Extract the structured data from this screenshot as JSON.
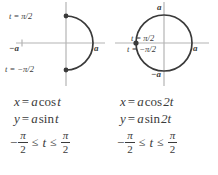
{
  "colors": {
    "curve": "#3a3a3a",
    "axis": "#b4b4b4",
    "text": "#3b3b3b",
    "background": "#ffffff"
  },
  "figures": [
    {
      "id": "semicircle-right-half",
      "shape": "semicircle",
      "description": "Right half of a circle of radius a, traced from bottom to top",
      "labels": {
        "t_top": "t = π/2",
        "t_bottom": "t = −π/2",
        "axis_left": "−a",
        "axis_right": "a"
      },
      "endpoints_marked": 2
    },
    {
      "id": "full-circle",
      "shape": "circle",
      "description": "Full circle of radius a traced twice as fast",
      "labels": {
        "axis_top": "a",
        "axis_bottom": "−a",
        "axis_right": "a",
        "t_pos": "t = π/2",
        "t_neg": "t = −π/2"
      },
      "endpoints_marked": 1
    }
  ],
  "equations": [
    {
      "x_lhs": "x",
      "x_eq": "=",
      "x_rhs_coef": "a",
      "x_rhs_fn": "cos",
      "x_rhs_arg": "t",
      "y_lhs": "y",
      "y_eq": "=",
      "y_rhs_coef": "a",
      "y_rhs_fn": "sin",
      "y_rhs_arg": "t",
      "domain": {
        "leading_minus": "−",
        "left_num": "π",
        "left_den": "2",
        "rel_left": "≤",
        "variable": "t",
        "rel_right": "≤",
        "right_num": "π",
        "right_den": "2"
      }
    },
    {
      "x_lhs": "x",
      "x_eq": "=",
      "x_rhs_coef": "a",
      "x_rhs_fn": "cos",
      "x_rhs_arg": "2t",
      "y_lhs": "y",
      "y_eq": "=",
      "y_rhs_coef": "a",
      "y_rhs_fn": "sin",
      "y_rhs_arg": "2t",
      "domain": {
        "leading_minus": "−",
        "left_num": "π",
        "left_den": "2",
        "rel_left": "≤",
        "variable": "t",
        "rel_right": "≤",
        "right_num": "π",
        "right_den": "2"
      }
    }
  ]
}
